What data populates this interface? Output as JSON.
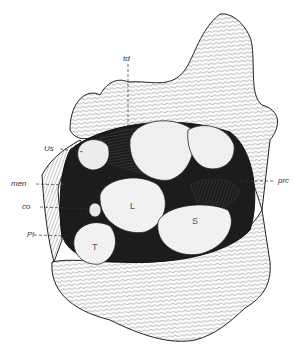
{
  "figure": {
    "type": "anatomical line drawing",
    "background": "#ffffff",
    "ink": "#1a1a1a",
    "stipple": "#d8d8d8"
  },
  "labels": {
    "td": "td",
    "us": "Us",
    "men": "men",
    "co": "co",
    "pi": "Pi",
    "prc": "prc"
  },
  "regions": {
    "L": "L",
    "S": "S",
    "T": "T"
  }
}
